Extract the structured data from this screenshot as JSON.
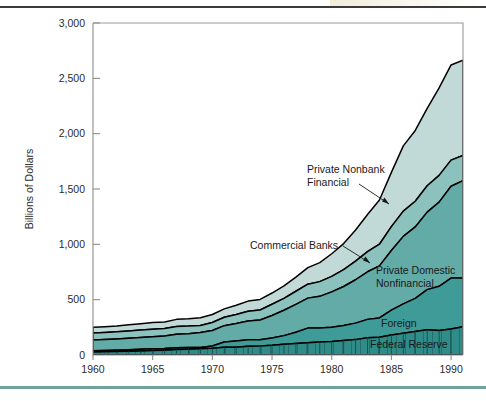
{
  "figure": {
    "top_rule": "dark-horizontal-rule",
    "bottom_rule": "teal-horizontal-rule"
  },
  "chart_data": {
    "type": "area",
    "stacked": true,
    "title": "",
    "xlabel": "",
    "ylabel": "Billions of Dollars",
    "xlim": [
      1960,
      1991
    ],
    "ylim": [
      0,
      3000
    ],
    "grid": false,
    "legend": "inline-annotations",
    "xticks": [
      1960,
      1965,
      1970,
      1975,
      1980,
      1985,
      1990
    ],
    "xticklabels": [
      "1960",
      "1965",
      "1970",
      "1975",
      "1980",
      "1985",
      "1990"
    ],
    "yticks": [
      0,
      500,
      1000,
      1500,
      2000,
      2500,
      3000
    ],
    "yticklabels": [
      "0",
      "500",
      "1,000",
      "1,500",
      "2,000",
      "2,500",
      "3,000"
    ],
    "x": [
      1960,
      1961,
      1962,
      1963,
      1964,
      1965,
      1966,
      1967,
      1968,
      1969,
      1970,
      1971,
      1972,
      1973,
      1974,
      1975,
      1976,
      1977,
      1978,
      1979,
      1980,
      1981,
      1982,
      1983,
      1984,
      1985,
      1986,
      1987,
      1988,
      1989,
      1990,
      1991
    ],
    "series": [
      {
        "name": "Federal Reserve",
        "color": "#2e8c89",
        "values": [
          27,
          29,
          31,
          34,
          37,
          41,
          44,
          49,
          53,
          57,
          62,
          70,
          71,
          78,
          81,
          87,
          97,
          105,
          110,
          117,
          121,
          131,
          139,
          156,
          160,
          181,
          197,
          212,
          229,
          221,
          235,
          255
        ]
      },
      {
        "name": "Foreign",
        "color": "#3f9b98",
        "values": [
          12,
          12,
          13,
          14,
          15,
          15,
          14,
          17,
          14,
          11,
          20,
          47,
          55,
          59,
          57,
          67,
          78,
          100,
          133,
          126,
          129,
          136,
          149,
          166,
          175,
          224,
          265,
          300,
          362,
          400,
          460,
          440
        ]
      },
      {
        "name": "Private Domestic Nonfinancial",
        "color": "#62aba7",
        "values": [
          97,
          99,
          101,
          104,
          107,
          110,
          114,
          121,
          126,
          135,
          140,
          148,
          158,
          170,
          178,
          203,
          229,
          253,
          271,
          287,
          320,
          352,
          392,
          430,
          470,
          540,
          610,
          645,
          700,
          760,
          830,
          880
        ]
      },
      {
        "name": "Commercial Banks",
        "color": "#8cc2be",
        "values": [
          62,
          63,
          64,
          65,
          66,
          67,
          67,
          71,
          68,
          64,
          72,
          76,
          82,
          88,
          91,
          102,
          108,
          118,
          126,
          133,
          140,
          152,
          168,
          182,
          196,
          215,
          228,
          232,
          238,
          242,
          236,
          228
        ]
      },
      {
        "name": "Private Nonbank Financial",
        "color": "#c2dad7",
        "values": [
          52,
          53,
          54,
          56,
          58,
          60,
          60,
          64,
          66,
          69,
          72,
          76,
          84,
          92,
          95,
          101,
          112,
          128,
          150,
          172,
          205,
          236,
          282,
          336,
          400,
          490,
          590,
          640,
          700,
          790,
          860,
          860
        ]
      }
    ],
    "annotations": [
      {
        "label_line1": "Private Nonbank",
        "label_line2": "Financial",
        "target_series": "Private Nonbank Financial"
      },
      {
        "label_line1": "Commercial Banks",
        "label_line2": "",
        "target_series": "Commercial Banks"
      },
      {
        "label_line1": "Private Domestic",
        "label_line2": "Nonfinancial",
        "target_series": "Private Domestic Nonfinancial"
      },
      {
        "label_line1": "Foreign",
        "label_line2": "",
        "target_series": "Foreign"
      },
      {
        "label_line1": "Federal Reserve",
        "label_line2": "",
        "target_series": "Federal Reserve"
      }
    ]
  }
}
